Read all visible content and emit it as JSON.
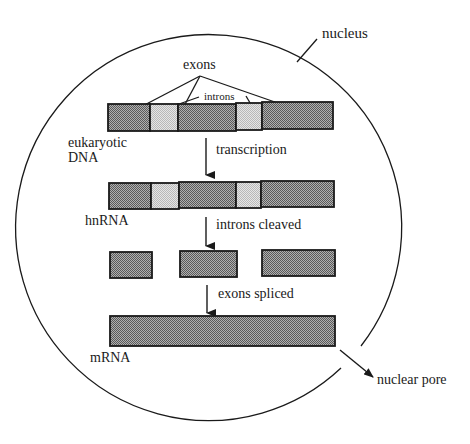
{
  "labels": {
    "nucleus": "nucleus",
    "exons": "exons",
    "introns": "introns",
    "dna_line1": "eukaryotic",
    "dna_line2": "DNA",
    "transcription": "transcription",
    "hnrna": "hnRNA",
    "introns_cleaved": "introns cleaved",
    "exons_spliced": "exons spliced",
    "mrna": "mRNA",
    "nuclear_pore": "nuclear pore"
  },
  "stages": [
    {
      "name": "eukaryotic DNA",
      "segments": [
        "exon",
        "intron",
        "exon",
        "intron",
        "exon"
      ]
    },
    {
      "name": "hnRNA",
      "segments": [
        "exon",
        "intron",
        "exon",
        "intron",
        "exon"
      ]
    },
    {
      "name": "cleaved exons",
      "segments": [
        "exon",
        "exon",
        "exon"
      ]
    },
    {
      "name": "mRNA",
      "segments": [
        "exon"
      ]
    }
  ],
  "steps": [
    "transcription",
    "introns cleaved",
    "exons spliced"
  ],
  "colors": {
    "exon_fill": "#8c8c8c",
    "intron_fill": "#d2d2d2",
    "stroke": "#1a1a1a"
  }
}
